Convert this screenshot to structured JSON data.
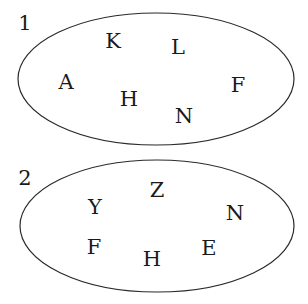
{
  "sets": [
    {
      "label": "1",
      "ellipse": {
        "cx": 156,
        "cy": 79,
        "rx": 138,
        "ry": 66
      },
      "label_pos": {
        "x": 25,
        "y": 30
      },
      "elements": [
        {
          "text": "K",
          "x": 113,
          "y": 48
        },
        {
          "text": "L",
          "x": 178,
          "y": 54
        },
        {
          "text": "A",
          "x": 66,
          "y": 89
        },
        {
          "text": "H",
          "x": 129,
          "y": 106
        },
        {
          "text": "N",
          "x": 184,
          "y": 123
        },
        {
          "text": "F",
          "x": 238,
          "y": 92
        }
      ]
    },
    {
      "label": "2",
      "ellipse": {
        "cx": 157,
        "cy": 226,
        "rx": 137,
        "ry": 66
      },
      "label_pos": {
        "x": 25,
        "y": 185
      },
      "elements": [
        {
          "text": "Z",
          "x": 157,
          "y": 197
        },
        {
          "text": "Y",
          "x": 95,
          "y": 214
        },
        {
          "text": "N",
          "x": 235,
          "y": 220
        },
        {
          "text": "F",
          "x": 94,
          "y": 254
        },
        {
          "text": "H",
          "x": 152,
          "y": 266
        },
        {
          "text": "E",
          "x": 209,
          "y": 255
        }
      ]
    }
  ],
  "colors": {
    "stroke": "#2a2a2a",
    "text": "#1a1a1a",
    "background": "#ffffff"
  }
}
